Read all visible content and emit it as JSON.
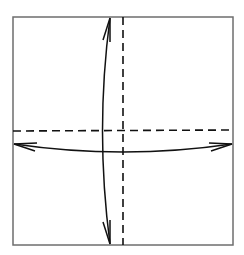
{
  "diagram": {
    "type": "origami-fold-diagram",
    "colors": {
      "paper_edge": "#6e6e6e",
      "fold_line": "#111111",
      "arrow": "#111111",
      "background": "#ffffff"
    },
    "square": {
      "x": 13,
      "y": 17,
      "width": 220,
      "height": 228
    },
    "fold_lines": [
      {
        "name": "vertical-valley-fold",
        "style": "dashed",
        "x1": 123,
        "y1": 17,
        "x2": 123,
        "y2": 245
      },
      {
        "name": "horizontal-valley-fold",
        "style": "dashed",
        "x1": 13,
        "y1": 131,
        "x2": 233,
        "y2": 130
      }
    ],
    "arrows": [
      {
        "name": "vertical-fold-unfold-arrow",
        "heads": "both",
        "from": [
          110,
          18
        ],
        "to": [
          110,
          244
        ],
        "curve_x": 102
      },
      {
        "name": "horizontal-fold-unfold-arrow",
        "heads": "both",
        "from": [
          14,
          144
        ],
        "to": [
          232,
          144
        ],
        "curve_y": 152
      }
    ]
  }
}
